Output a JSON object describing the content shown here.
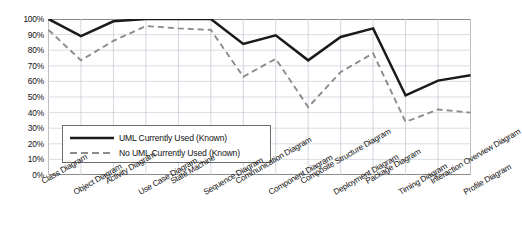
{
  "chart_data": {
    "type": "line",
    "title": "",
    "xlabel": "",
    "ylabel": "",
    "ylim": [
      0,
      100
    ],
    "ytick_labels": [
      "100%",
      "90%",
      "80%",
      "70%",
      "60%",
      "50%",
      "40%",
      "30%",
      "20%",
      "10%",
      "0%"
    ],
    "ytick_values": [
      100,
      90,
      80,
      70,
      60,
      50,
      40,
      30,
      20,
      10,
      0
    ],
    "grid": true,
    "legend_position": "inside-lower-left",
    "categories": [
      "Class Diagram",
      "Object Diagram",
      "Activity Diagram",
      "Use Case Diagram",
      "State Machine",
      "Sequence Diagram",
      "Communication Diagram",
      "Component Diagram",
      "Composite Structure Diagram",
      "Deployment Diagram",
      "Package Diagram",
      "Timing Diagram",
      "Interaction Overview Diagram",
      "Profile Diagram"
    ],
    "series": [
      {
        "name": "UML Currently Used  (Known)",
        "style": "solid",
        "color": "#1a1a1a",
        "values": [
          100,
          89,
          98.5,
          100,
          100,
          100,
          84,
          89.5,
          73.5,
          88.5,
          94,
          51,
          60.5,
          64
        ]
      },
      {
        "name": "No UML Currently Used  (Known)",
        "style": "dashed",
        "color": "#8c8c8c",
        "values": [
          93,
          73.5,
          86,
          95.5,
          94,
          93,
          63,
          74.5,
          43.5,
          66,
          78,
          34,
          42,
          40
        ]
      }
    ]
  },
  "legend": {
    "items": [
      {
        "label": "UML Currently Used  (Known)"
      },
      {
        "label": "No UML Currently Used  (Known)"
      }
    ]
  }
}
